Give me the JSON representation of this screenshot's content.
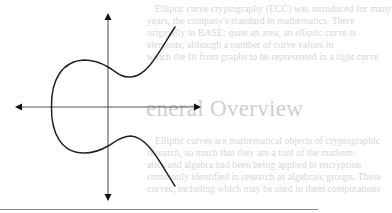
{
  "figure": {
    "type": "elliptic-curve-plot",
    "axes": {
      "x_axis": {
        "arrows": "both"
      },
      "y_axis": {
        "arrows": "both"
      }
    },
    "stroke_color": "#222222",
    "axis_color": "#555555"
  },
  "text": {
    "top_paragraph": [
      "Elliptic curve cryptography (ECC) was introduced for many",
      "years, the company's standard in mathematics. There",
      "originally in BASE: quite an area, an elliptic curve is",
      "elements, although a number of curve values in",
      "which the fit from graphs to be represented in a tight curve"
    ],
    "heading": "eneral Overview",
    "bottom_paragraph": [
      "Elliptic curves are mathematical objects of cryptographic",
      "research, so much that they are a tool of the mathem-",
      "atics and algebra had been being applied to encryption",
      "commonly identified in research as algebraic groups. These",
      "curves, including which may be used in them computations"
    ]
  },
  "colors": {
    "background": "#ffffff",
    "faded_text": "#d6d6d6",
    "curve": "#222222",
    "rule": "#8a8a8a"
  }
}
